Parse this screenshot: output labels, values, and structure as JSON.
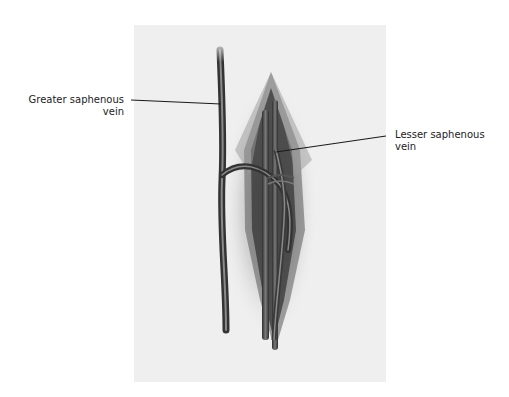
{
  "figure": {
    "labels": {
      "greater": {
        "line1": "Greater saphenous",
        "line2": "vein"
      },
      "lesser": {
        "line1": "Lesser saphenous",
        "line2": "vein"
      }
    },
    "colors": {
      "panel": "#efefef",
      "vein_dark": "#3a3a3a",
      "vein_mid": "#6a6a6a",
      "leader_line": "#1a1a1a",
      "text": "#222222"
    }
  }
}
